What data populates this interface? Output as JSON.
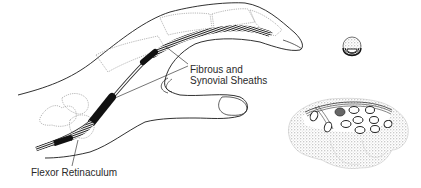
{
  "figure": {
    "labels": {
      "sheaths_line1": "Fibrous and",
      "sheaths_line2": "Synovial Sheaths",
      "retinaculum": "Flexor Retinaculum"
    },
    "insets": [
      {
        "name": "finger-cross-section"
      },
      {
        "name": "carpal-tunnel-cross-section"
      }
    ],
    "colors": {
      "outline": "#1a1a1a",
      "bone_outline": "#9a9a9a",
      "sheath_fill": "#111111",
      "stipple": "#bdbdbd",
      "background": "#ffffff"
    }
  }
}
